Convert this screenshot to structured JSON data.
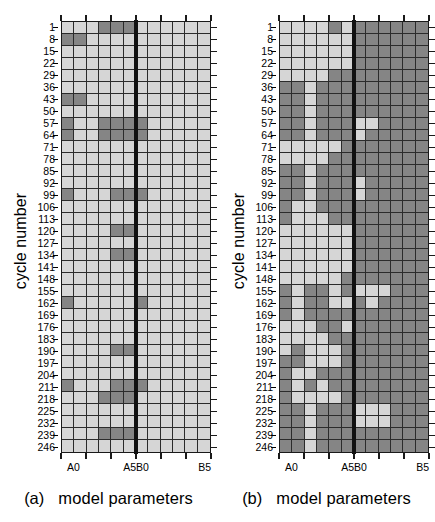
{
  "figure": {
    "axis": {
      "ylabel": "cycle number",
      "xlabel": "model parameters",
      "ytick_labels": [
        "1",
        "8",
        "15",
        "22",
        "29",
        "36",
        "43",
        "50",
        "57",
        "64",
        "71",
        "78",
        "85",
        "92",
        "99",
        "106",
        "113",
        "120",
        "127",
        "134",
        "141",
        "148",
        "155",
        "162",
        "169",
        "176",
        "183",
        "190",
        "197",
        "204",
        "211",
        "218",
        "225",
        "232",
        "239",
        "246"
      ],
      "xtick_labels": [
        "A0",
        "A5B0",
        "B5"
      ],
      "xtick_positions_pct": [
        8.333,
        50.0,
        95.833
      ],
      "parameter_names": [
        "A0",
        "A1",
        "A2",
        "A3",
        "A4",
        "A5",
        "B0",
        "B1",
        "B2",
        "B3",
        "B4",
        "B5"
      ]
    },
    "colors": {
      "light_cell": "#d6d6d6",
      "dark_cell": "#858585",
      "gridline": "#2b2b2b",
      "frame": "#1a1a1a",
      "divider": "#111111",
      "background": "#ffffff"
    },
    "legend": {
      "light_meaning": "parameter inactive / not selected",
      "dark_meaning": "parameter active / selected"
    },
    "panels": [
      {
        "tag": "(a)",
        "xlabel": "model parameters"
      },
      {
        "tag": "(b)",
        "xlabel": "model parameters"
      }
    ]
  },
  "chart_data": {
    "type": "heatmap",
    "title": "",
    "xlabel": "model parameters",
    "ylabel": "cycle number",
    "grid": true,
    "legend_position": "none",
    "columns": [
      "A0",
      "A1",
      "A2",
      "A3",
      "A4",
      "A5",
      "B0",
      "B1",
      "B2",
      "B3",
      "B4",
      "B5"
    ],
    "xtick_labels": [
      "A0",
      "A5B0",
      "B5"
    ],
    "rows": [
      "1",
      "8",
      "15",
      "22",
      "29",
      "36",
      "43",
      "50",
      "57",
      "64",
      "71",
      "78",
      "85",
      "92",
      "99",
      "106",
      "113",
      "120",
      "127",
      "134",
      "141",
      "148",
      "155",
      "162",
      "169",
      "176",
      "183",
      "190",
      "197",
      "204",
      "211",
      "218",
      "225",
      "232",
      "239",
      "246"
    ],
    "value_map": {
      "0": "light gray (#d6d6d6)",
      "1": "dark gray (#858585)"
    },
    "panels": [
      {
        "name": "(a)",
        "values": [
          [
            0,
            0,
            0,
            1,
            1,
            1,
            0,
            0,
            0,
            0,
            0,
            0
          ],
          [
            1,
            1,
            0,
            0,
            0,
            0,
            0,
            0,
            0,
            0,
            0,
            0
          ],
          [
            0,
            0,
            0,
            0,
            0,
            0,
            0,
            0,
            0,
            0,
            0,
            0
          ],
          [
            0,
            0,
            0,
            0,
            0,
            0,
            0,
            0,
            0,
            0,
            0,
            0
          ],
          [
            0,
            0,
            0,
            0,
            0,
            0,
            0,
            0,
            0,
            0,
            0,
            0
          ],
          [
            0,
            0,
            0,
            0,
            0,
            0,
            0,
            0,
            0,
            0,
            0,
            0
          ],
          [
            1,
            1,
            0,
            0,
            0,
            0,
            0,
            0,
            0,
            0,
            0,
            0
          ],
          [
            0,
            0,
            0,
            0,
            0,
            0,
            0,
            0,
            0,
            0,
            0,
            0
          ],
          [
            1,
            0,
            0,
            1,
            1,
            1,
            1,
            0,
            0,
            0,
            0,
            0
          ],
          [
            1,
            0,
            0,
            1,
            1,
            1,
            1,
            0,
            0,
            0,
            0,
            0
          ],
          [
            0,
            0,
            0,
            0,
            0,
            0,
            0,
            0,
            0,
            0,
            0,
            0
          ],
          [
            0,
            0,
            0,
            0,
            0,
            0,
            0,
            0,
            0,
            0,
            0,
            0
          ],
          [
            0,
            0,
            0,
            0,
            0,
            0,
            0,
            0,
            0,
            0,
            0,
            0
          ],
          [
            0,
            0,
            0,
            0,
            0,
            0,
            0,
            0,
            0,
            0,
            0,
            0
          ],
          [
            1,
            0,
            0,
            0,
            1,
            1,
            1,
            0,
            0,
            0,
            0,
            0
          ],
          [
            0,
            0,
            0,
            0,
            0,
            0,
            0,
            0,
            0,
            0,
            0,
            0
          ],
          [
            0,
            0,
            0,
            0,
            0,
            0,
            0,
            0,
            0,
            0,
            0,
            0
          ],
          [
            0,
            0,
            0,
            0,
            1,
            1,
            0,
            0,
            0,
            0,
            0,
            0
          ],
          [
            0,
            0,
            0,
            0,
            0,
            0,
            0,
            0,
            0,
            0,
            0,
            0
          ],
          [
            0,
            0,
            0,
            0,
            1,
            1,
            0,
            0,
            0,
            0,
            0,
            0
          ],
          [
            0,
            0,
            0,
            0,
            0,
            0,
            0,
            0,
            0,
            0,
            0,
            0
          ],
          [
            0,
            0,
            0,
            0,
            0,
            0,
            0,
            0,
            0,
            0,
            0,
            0
          ],
          [
            0,
            0,
            0,
            0,
            0,
            0,
            0,
            0,
            0,
            0,
            0,
            0
          ],
          [
            1,
            0,
            0,
            0,
            0,
            0,
            1,
            0,
            0,
            0,
            0,
            0
          ],
          [
            0,
            0,
            0,
            0,
            0,
            0,
            0,
            0,
            0,
            0,
            0,
            0
          ],
          [
            0,
            0,
            0,
            0,
            0,
            0,
            0,
            0,
            0,
            0,
            0,
            0
          ],
          [
            0,
            0,
            0,
            0,
            0,
            0,
            0,
            0,
            0,
            0,
            0,
            0
          ],
          [
            0,
            0,
            0,
            0,
            1,
            1,
            0,
            0,
            0,
            0,
            0,
            0
          ],
          [
            0,
            0,
            0,
            0,
            0,
            0,
            0,
            0,
            0,
            0,
            0,
            0
          ],
          [
            0,
            0,
            0,
            0,
            0,
            0,
            0,
            0,
            0,
            0,
            0,
            0
          ],
          [
            1,
            0,
            0,
            0,
            1,
            1,
            1,
            0,
            0,
            0,
            0,
            0
          ],
          [
            0,
            0,
            0,
            1,
            1,
            1,
            0,
            0,
            0,
            0,
            0,
            0
          ],
          [
            0,
            0,
            0,
            0,
            0,
            0,
            0,
            0,
            0,
            0,
            0,
            0
          ],
          [
            0,
            0,
            0,
            0,
            0,
            0,
            0,
            0,
            0,
            0,
            0,
            0
          ],
          [
            0,
            0,
            0,
            1,
            1,
            1,
            0,
            0,
            0,
            0,
            0,
            0
          ],
          [
            0,
            0,
            0,
            0,
            0,
            0,
            0,
            0,
            0,
            0,
            0,
            0
          ]
        ]
      },
      {
        "name": "(b)",
        "values": [
          [
            0,
            0,
            0,
            0,
            1,
            0,
            1,
            1,
            1,
            1,
            1,
            1
          ],
          [
            0,
            0,
            0,
            0,
            0,
            0,
            1,
            1,
            1,
            1,
            1,
            1
          ],
          [
            0,
            0,
            0,
            0,
            0,
            0,
            1,
            1,
            1,
            1,
            1,
            1
          ],
          [
            0,
            0,
            0,
            0,
            0,
            0,
            1,
            1,
            1,
            1,
            1,
            1
          ],
          [
            0,
            0,
            0,
            0,
            1,
            1,
            1,
            1,
            1,
            1,
            1,
            1
          ],
          [
            1,
            1,
            0,
            1,
            1,
            1,
            1,
            1,
            1,
            1,
            1,
            1
          ],
          [
            1,
            1,
            0,
            1,
            1,
            1,
            1,
            1,
            1,
            1,
            1,
            1
          ],
          [
            1,
            1,
            0,
            1,
            1,
            1,
            1,
            1,
            1,
            1,
            1,
            1
          ],
          [
            1,
            1,
            0,
            1,
            1,
            1,
            0,
            0,
            1,
            1,
            1,
            1
          ],
          [
            1,
            1,
            0,
            1,
            1,
            1,
            0,
            1,
            1,
            1,
            1,
            1
          ],
          [
            0,
            0,
            0,
            0,
            0,
            1,
            1,
            1,
            1,
            1,
            1,
            1
          ],
          [
            0,
            0,
            0,
            0,
            1,
            1,
            1,
            1,
            1,
            1,
            1,
            1
          ],
          [
            1,
            1,
            0,
            1,
            1,
            1,
            1,
            1,
            1,
            1,
            1,
            1
          ],
          [
            1,
            1,
            0,
            1,
            1,
            1,
            0,
            1,
            1,
            1,
            1,
            1
          ],
          [
            1,
            1,
            0,
            1,
            1,
            1,
            0,
            1,
            1,
            1,
            1,
            1
          ],
          [
            1,
            0,
            0,
            1,
            1,
            1,
            1,
            1,
            1,
            1,
            1,
            1
          ],
          [
            1,
            0,
            0,
            0,
            1,
            1,
            1,
            1,
            1,
            1,
            1,
            1
          ],
          [
            0,
            0,
            0,
            0,
            0,
            0,
            1,
            1,
            1,
            1,
            1,
            1
          ],
          [
            0,
            0,
            0,
            0,
            0,
            0,
            1,
            1,
            1,
            1,
            1,
            1
          ],
          [
            0,
            0,
            0,
            0,
            0,
            0,
            1,
            1,
            1,
            1,
            1,
            1
          ],
          [
            0,
            0,
            0,
            0,
            0,
            0,
            1,
            1,
            1,
            1,
            1,
            1
          ],
          [
            0,
            0,
            0,
            0,
            0,
            1,
            1,
            1,
            1,
            1,
            1,
            1
          ],
          [
            1,
            0,
            1,
            1,
            0,
            1,
            0,
            0,
            0,
            1,
            1,
            1
          ],
          [
            1,
            0,
            1,
            1,
            0,
            0,
            1,
            0,
            1,
            1,
            1,
            1
          ],
          [
            1,
            0,
            1,
            1,
            1,
            1,
            1,
            1,
            1,
            1,
            1,
            1
          ],
          [
            0,
            0,
            0,
            1,
            1,
            0,
            1,
            1,
            1,
            1,
            1,
            1
          ],
          [
            0,
            0,
            0,
            0,
            1,
            1,
            1,
            1,
            1,
            1,
            1,
            1
          ],
          [
            0,
            1,
            0,
            0,
            0,
            1,
            1,
            1,
            1,
            1,
            1,
            1
          ],
          [
            1,
            1,
            0,
            0,
            0,
            1,
            1,
            1,
            1,
            1,
            1,
            1
          ],
          [
            1,
            0,
            0,
            1,
            1,
            1,
            1,
            1,
            1,
            1,
            1,
            1
          ],
          [
            1,
            0,
            1,
            0,
            1,
            1,
            1,
            1,
            1,
            1,
            1,
            1
          ],
          [
            1,
            0,
            0,
            0,
            0,
            1,
            1,
            1,
            1,
            1,
            1,
            1
          ],
          [
            1,
            1,
            0,
            1,
            1,
            1,
            0,
            0,
            0,
            1,
            1,
            1
          ],
          [
            1,
            1,
            0,
            1,
            1,
            1,
            0,
            0,
            0,
            1,
            1,
            1
          ],
          [
            1,
            1,
            0,
            1,
            1,
            1,
            1,
            1,
            1,
            1,
            1,
            1
          ],
          [
            1,
            1,
            0,
            1,
            1,
            1,
            1,
            1,
            1,
            1,
            1,
            1
          ]
        ]
      }
    ]
  }
}
